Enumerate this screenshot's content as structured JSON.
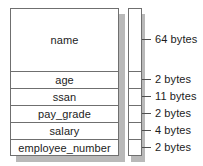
{
  "diagram": {
    "record": {
      "name": "record-struct",
      "fields": [
        {
          "label": "name",
          "size": "64 bytes",
          "height": "tall"
        },
        {
          "label": "age",
          "size": "2 bytes",
          "height": "short"
        },
        {
          "label": "ssan",
          "size": "11 bytes",
          "height": "short"
        },
        {
          "label": "pay_grade",
          "size": "2 bytes",
          "height": "short"
        },
        {
          "label": "salary",
          "size": "4 bytes",
          "height": "short"
        },
        {
          "label": "employee_number",
          "size": "2 bytes",
          "height": "short"
        }
      ]
    },
    "colors": {
      "border": "#6f6f6f",
      "shadow": "#b9b9b9",
      "text": "#1c1c1c",
      "background": "#ffffff"
    }
  }
}
